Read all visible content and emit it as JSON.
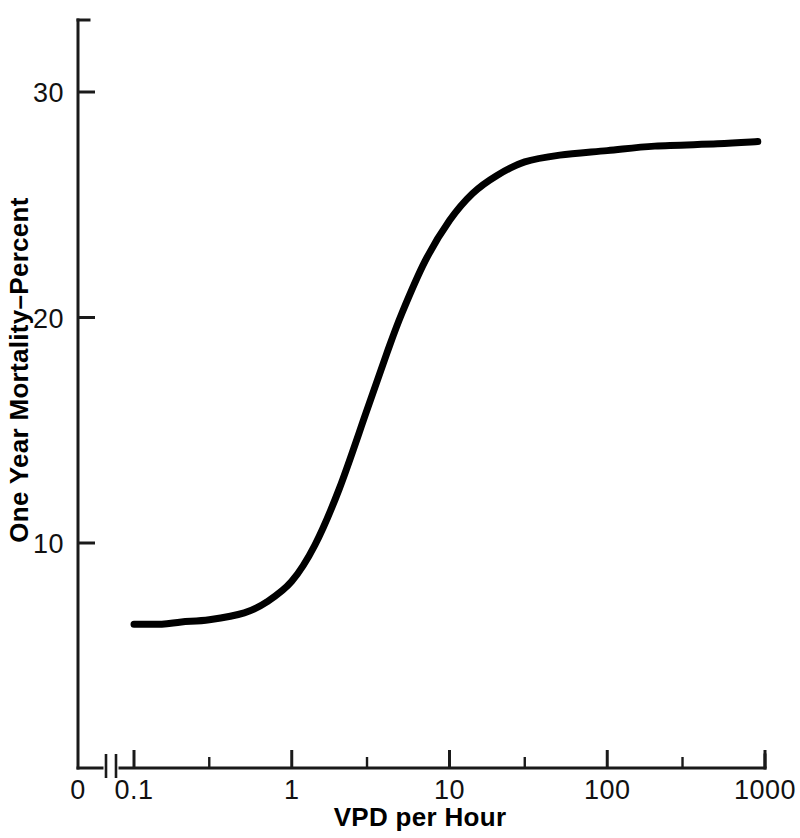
{
  "figure": {
    "background_color": "#ffffff",
    "ink_color": "#000000"
  },
  "chart_data": {
    "type": "line",
    "title": "",
    "subtitle": "",
    "xlabel": "VPD per Hour",
    "ylabel": "One Year Mortality–Percent",
    "x_scale": "log",
    "y_scale": "linear",
    "xlim": [
      0.1,
      1000
    ],
    "ylim": [
      0,
      34
    ],
    "grid": false,
    "legend": null,
    "x_axis_break": true,
    "x_break_note": "axis break between 0 and 0.1",
    "xticks": [
      {
        "value": 0,
        "label": "0",
        "type": "origin"
      },
      {
        "value": 0.1,
        "label": "0.1",
        "type": "major"
      },
      {
        "value": 0.3,
        "label": "",
        "type": "minor"
      },
      {
        "value": 1,
        "label": "1",
        "type": "major"
      },
      {
        "value": 3,
        "label": "",
        "type": "minor"
      },
      {
        "value": 10,
        "label": "10",
        "type": "major"
      },
      {
        "value": 30,
        "label": "",
        "type": "minor"
      },
      {
        "value": 100,
        "label": "100",
        "type": "major"
      },
      {
        "value": 300,
        "label": "",
        "type": "minor"
      },
      {
        "value": 1000,
        "label": "1000",
        "type": "major"
      }
    ],
    "yticks": [
      {
        "value": 10,
        "label": "10"
      },
      {
        "value": 20,
        "label": "20"
      },
      {
        "value": 30,
        "label": "30"
      }
    ],
    "series": [
      {
        "name": "One Year Mortality",
        "color": "#000000",
        "points": [
          {
            "x": 0.1,
            "y": 6.4
          },
          {
            "x": 0.15,
            "y": 6.4
          },
          {
            "x": 0.2,
            "y": 6.5
          },
          {
            "x": 0.3,
            "y": 6.6
          },
          {
            "x": 0.5,
            "y": 6.9
          },
          {
            "x": 0.7,
            "y": 7.4
          },
          {
            "x": 1.0,
            "y": 8.3
          },
          {
            "x": 1.4,
            "y": 9.9
          },
          {
            "x": 2.0,
            "y": 12.4
          },
          {
            "x": 3.0,
            "y": 15.9
          },
          {
            "x": 4.0,
            "y": 18.4
          },
          {
            "x": 5.0,
            "y": 20.2
          },
          {
            "x": 7.0,
            "y": 22.5
          },
          {
            "x": 10.0,
            "y": 24.3
          },
          {
            "x": 14.0,
            "y": 25.5
          },
          {
            "x": 20.0,
            "y": 26.3
          },
          {
            "x": 30.0,
            "y": 26.9
          },
          {
            "x": 50.0,
            "y": 27.2
          },
          {
            "x": 100.0,
            "y": 27.4
          },
          {
            "x": 200.0,
            "y": 27.6
          },
          {
            "x": 500.0,
            "y": 27.7
          },
          {
            "x": 900.0,
            "y": 27.8
          }
        ]
      }
    ]
  },
  "caption": {
    "cropped_text": ""
  }
}
